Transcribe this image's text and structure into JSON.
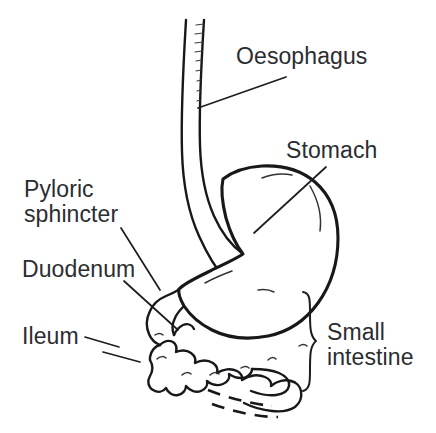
{
  "figure": {
    "background_color": "#ffffff",
    "line_color": "#17181a",
    "text_color": "#2b2d30"
  },
  "labels": {
    "oesophagus": "Oesophagus",
    "stomach": "Stomach",
    "pyloric_sphincter": "Pyloric\nsphincter",
    "duodenum": "Duodenum",
    "ileum": "Ileum",
    "small_intestine": "Small\nintestine"
  },
  "parts": [
    {
      "name": "oesophagus",
      "label": "Oesophagus"
    },
    {
      "name": "stomach",
      "label": "Stomach"
    },
    {
      "name": "pyloric-sphincter",
      "label": "Pyloric sphincter"
    },
    {
      "name": "duodenum",
      "label": "Duodenum"
    },
    {
      "name": "ileum",
      "label": "Ileum"
    },
    {
      "name": "small-intestine",
      "label": "Small intestine"
    }
  ]
}
